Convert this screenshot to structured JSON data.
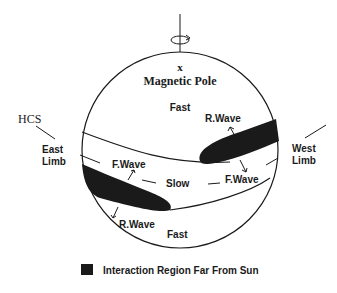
{
  "labels": {
    "pole_marker": "x",
    "magnetic_pole": "Magnetic Pole",
    "fast_top": "Fast",
    "fast_bottom": "Fast",
    "slow": "Slow",
    "hcs": "HCS",
    "east_limb_1": "East",
    "east_limb_2": "Limb",
    "west_limb_1": "West",
    "west_limb_2": "Limb",
    "r_wave_top": "R.Wave",
    "r_wave_bottom": "R.Wave",
    "f_wave_left": "F.Wave",
    "f_wave_right": "F.Wave"
  },
  "legend": {
    "label": "Interaction Region Far From Sun"
  },
  "icons": {
    "rotation": "rotation-arrow-icon"
  },
  "colors": {
    "ink": "#1a1a1a",
    "background": "#ffffff"
  }
}
